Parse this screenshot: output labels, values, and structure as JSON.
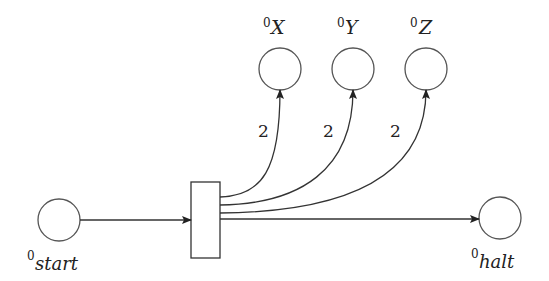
{
  "diagram": {
    "type": "petri-net",
    "places": [
      {
        "id": "start",
        "label": "start",
        "superscript": "0"
      },
      {
        "id": "X",
        "label": "X",
        "superscript": "0"
      },
      {
        "id": "Y",
        "label": "Y",
        "superscript": "0"
      },
      {
        "id": "Z",
        "label": "Z",
        "superscript": "0"
      },
      {
        "id": "halt",
        "label": "halt",
        "superscript": "0"
      }
    ],
    "transitions": [
      {
        "id": "t"
      }
    ],
    "arcs": [
      {
        "from": "start",
        "to": "t",
        "weight": ""
      },
      {
        "from": "t",
        "to": "X",
        "weight": "2"
      },
      {
        "from": "t",
        "to": "Y",
        "weight": "2"
      },
      {
        "from": "t",
        "to": "Z",
        "weight": "2"
      },
      {
        "from": "t",
        "to": "halt",
        "weight": ""
      }
    ]
  }
}
